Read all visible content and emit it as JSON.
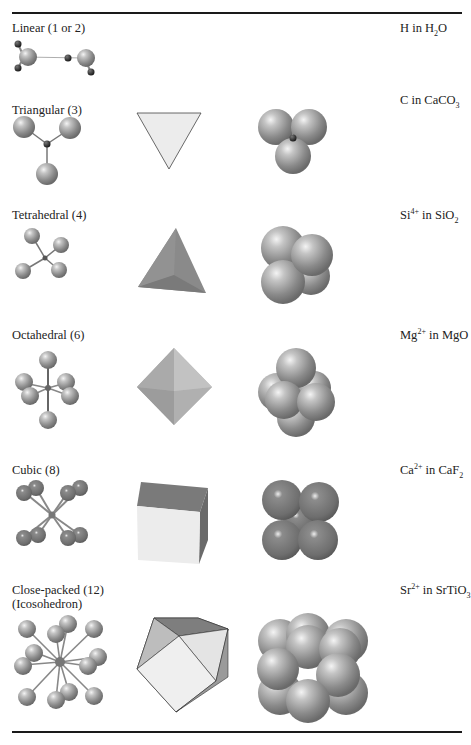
{
  "table": {
    "columns": [
      "Geometry (coordination number)",
      "Ball-and-stick",
      "Polyhedron",
      "Space-filling",
      "Example"
    ],
    "rows": [
      {
        "label": "Linear (1 or 2)",
        "example": {
          "ion": "H",
          "charge": "",
          "compound_parts": [
            "H",
            "2",
            "O"
          ],
          "text": "H in H2O"
        }
      },
      {
        "label": "Triangular (3)",
        "example": {
          "ion": "C",
          "charge": "",
          "compound_parts": [
            "CaCO",
            "3",
            ""
          ],
          "text": "C in CaCO3"
        }
      },
      {
        "label": "Tetrahedral (4)",
        "example": {
          "ion": "Si",
          "charge": "4+",
          "compound_parts": [
            "SiO",
            "2",
            ""
          ],
          "text": "Si4+ in SiO2"
        }
      },
      {
        "label": "Octahedral (6)",
        "example": {
          "ion": "Mg",
          "charge": "2+",
          "compound_parts": [
            "MgO",
            "",
            ""
          ],
          "text": "Mg2+ in MgO"
        }
      },
      {
        "label": "Cubic (8)",
        "example": {
          "ion": "Ca",
          "charge": "2+",
          "compound_parts": [
            "CaF",
            "2",
            ""
          ],
          "text": "Ca2+ in CaF2"
        }
      },
      {
        "label": "Close-packed (12)\n(Icosohedron)",
        "example": {
          "ion": "Sr",
          "charge": "2+",
          "compound_parts": [
            "SrTiO",
            "3",
            ""
          ],
          "text": "Sr2+ in SrTiO3"
        }
      }
    ]
  },
  "colors": {
    "sphere": "#8e8e8e",
    "sphere_highlight": "#f2f2f2",
    "center_atom": "#2a2a2a",
    "poly_light": "#e6e6e6",
    "poly_mid": "#b4b4b4",
    "poly_dark": "#7c7c7c",
    "rule": "#1a1a1a"
  }
}
